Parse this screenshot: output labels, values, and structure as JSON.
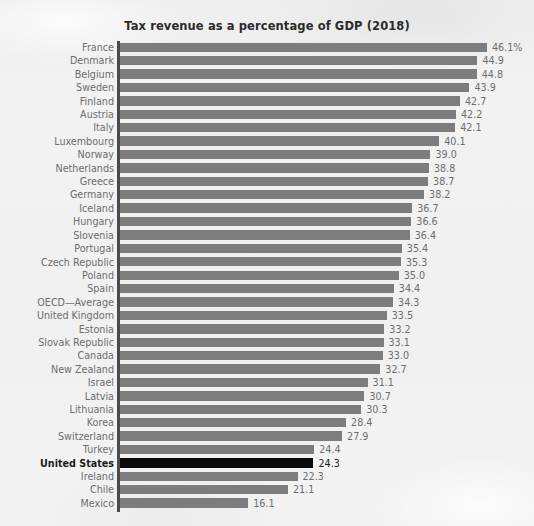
{
  "chart_data": {
    "type": "bar",
    "orientation": "horizontal",
    "title": "Tax revenue as a percentage of GDP (2018)",
    "xlabel": "",
    "ylabel": "",
    "xlim": [
      0,
      46.1
    ],
    "grid": false,
    "legend": null,
    "value_suffix_first": "%",
    "highlight_category": "United States",
    "colors": {
      "bar": "#7d7d7d",
      "bar_highlight": "#0a0a0a",
      "background": "#f1f1f1",
      "axis": "#4a4a4a",
      "label_text": "#6d6d6d",
      "highlight_text": "#1c1c1c",
      "title_text": "#2b2b2b"
    },
    "categories": [
      "France",
      "Denmark",
      "Belgium",
      "Sweden",
      "Finland",
      "Austria",
      "Italy",
      "Luxembourg",
      "Norway",
      "Netherlands",
      "Greece",
      "Germany",
      "Iceland",
      "Hungary",
      "Slovenia",
      "Portugal",
      "Czech Republic",
      "Poland",
      "Spain",
      "OECD—Average",
      "United Kingdom",
      "Estonia",
      "Slovak Republic",
      "Canada",
      "New Zealand",
      "Israel",
      "Latvia",
      "Lithuania",
      "Korea",
      "Switzerland",
      "Turkey",
      "United States",
      "Ireland",
      "Chile",
      "Mexico"
    ],
    "values": [
      46.1,
      44.9,
      44.8,
      43.9,
      42.7,
      42.2,
      42.1,
      40.1,
      39.0,
      38.8,
      38.7,
      38.2,
      36.7,
      36.6,
      36.4,
      35.4,
      35.3,
      35.0,
      34.4,
      34.3,
      33.5,
      33.2,
      33.1,
      33.0,
      32.7,
      31.1,
      30.7,
      30.3,
      28.4,
      27.9,
      24.4,
      24.3,
      22.3,
      21.1,
      16.1
    ],
    "value_labels": [
      "46.1%",
      "44.9",
      "44.8",
      "43.9",
      "42.7",
      "42.2",
      "42.1",
      "40.1",
      "39.0",
      "38.8",
      "38.7",
      "38.2",
      "36.7",
      "36.6",
      "36.4",
      "35.4",
      "35.3",
      "35.0",
      "34.4",
      "34.3",
      "33.5",
      "33.2",
      "33.1",
      "33.0",
      "32.7",
      "31.1",
      "30.7",
      "30.3",
      "28.4",
      "27.9",
      "24.4",
      "24.3",
      "22.3",
      "21.1",
      "16.1"
    ]
  }
}
